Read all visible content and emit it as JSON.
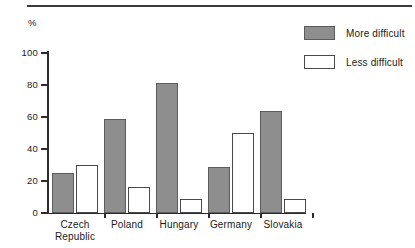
{
  "chart_data": {
    "type": "bar",
    "title": "",
    "subtitle": "",
    "xlabel": "",
    "ylabel": "%",
    "ylim": [
      0,
      100
    ],
    "yticks": [
      0,
      20,
      40,
      60,
      80,
      100
    ],
    "ytick_labels": [
      "0",
      "20",
      "40",
      "60",
      "80",
      "100"
    ],
    "grid": false,
    "legend_position": "top-right",
    "categories": [
      "Czech\nRepublic",
      "Poland",
      "Hungary",
      "Germany",
      "Slovakia"
    ],
    "category_labels": [
      "Czech\nRepublic",
      "Poland",
      "Hungary",
      "Germany",
      "Slovakia"
    ],
    "series": [
      {
        "name": "More difficult",
        "color": "#8e8e8e",
        "values": [
          25,
          59,
          81,
          29,
          64
        ]
      },
      {
        "name": "Less difficult",
        "color": "#ffffff",
        "values": [
          30,
          16,
          9,
          50,
          9
        ]
      }
    ]
  },
  "legend": {
    "items": [
      {
        "label": "More difficult",
        "style": "more"
      },
      {
        "label": "Less difficult",
        "style": "less"
      }
    ]
  }
}
